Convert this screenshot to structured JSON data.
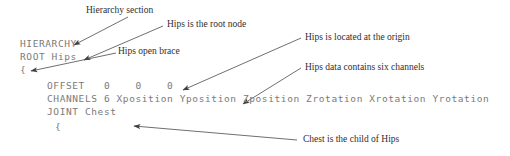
{
  "figure": {
    "background_color": "#ffffff",
    "code_color": "#7a7a7a",
    "annotation_color": "#2e2e2e",
    "leader_color": "#4a4a4a"
  },
  "code": {
    "lines": [
      {
        "id": "hierarchy",
        "text": "HIERARCHY",
        "x": 20,
        "y": 44
      },
      {
        "id": "root-hips",
        "text": "ROOT Hips",
        "x": 20,
        "y": 57
      },
      {
        "id": "open-brace",
        "text": "{",
        "x": 20,
        "y": 70
      },
      {
        "id": "offset",
        "text": "OFFSET   0    0    0",
        "x": 47,
        "y": 86
      },
      {
        "id": "channels",
        "text": "CHANNELS 6 Xposition Yposition Zposition Zrotation Xrotation Yrotation",
        "x": 47,
        "y": 99
      },
      {
        "id": "joint-chest",
        "text": "JOINT Chest",
        "x": 47,
        "y": 112
      },
      {
        "id": "chest-open-brace",
        "text": "{",
        "x": 55,
        "y": 127
      }
    ]
  },
  "annotations": [
    {
      "id": "hierarchy-section",
      "text": "Hierarchy section",
      "x": 86,
      "y": 5
    },
    {
      "id": "hips-root-node",
      "text": "Hips is the root node",
      "x": 167,
      "y": 19
    },
    {
      "id": "hips-open-brace",
      "text": "Hips open brace",
      "x": 118,
      "y": 46
    },
    {
      "id": "hips-origin",
      "text": "Hips is located at the origin",
      "x": 305,
      "y": 32
    },
    {
      "id": "hips-six-channels",
      "text": "Hips data contains six channels",
      "x": 305,
      "y": 62
    },
    {
      "id": "chest-child-of-hips",
      "text": "Chest is the child of Hips",
      "x": 303,
      "y": 134
    }
  ],
  "leader_lines": [
    {
      "id": "leader-hierarchy-section",
      "x1": 128,
      "y1": 17,
      "x2": 74,
      "y2": 45
    },
    {
      "id": "leader-hips-root-node",
      "x1": 163,
      "y1": 26,
      "x2": 84,
      "y2": 60
    },
    {
      "id": "leader-hips-open-brace",
      "x1": 116,
      "y1": 53,
      "x2": 31,
      "y2": 71
    },
    {
      "id": "leader-hips-origin",
      "x1": 301,
      "y1": 38,
      "x2": 183,
      "y2": 90
    },
    {
      "id": "leader-hips-six-channels",
      "x1": 301,
      "y1": 68,
      "x2": 243,
      "y2": 104
    },
    {
      "id": "leader-chest-child",
      "x1": 297,
      "y1": 140,
      "x2": 134,
      "y2": 126
    }
  ]
}
